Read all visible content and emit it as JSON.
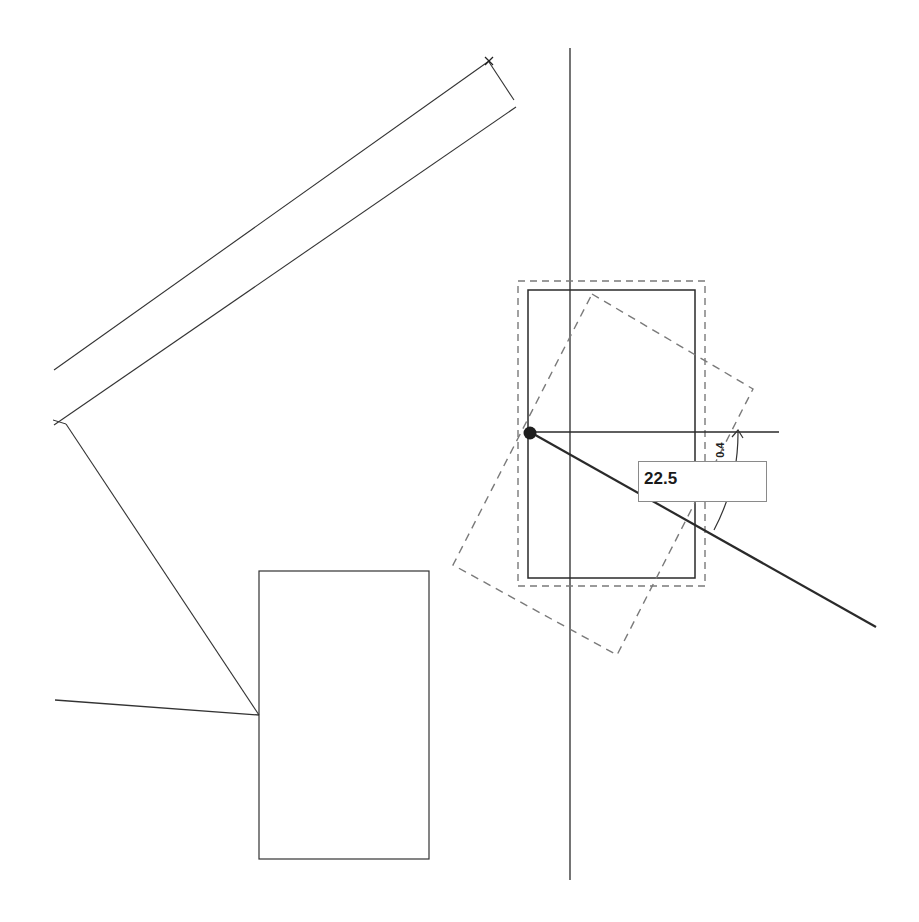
{
  "app": {
    "type": "CAD drawing canvas",
    "mode": "rotate"
  },
  "rotation_input": {
    "value": "22.5"
  },
  "angle_dimension": {
    "label": "0.4"
  },
  "colors": {
    "background": "#ffffff",
    "line": "#2a2a2a",
    "dashed_preview": "#7a7a7a",
    "input_border": "#8a8a8a"
  },
  "geometry": {
    "guide_vertical": {
      "x": 570,
      "y1": 48,
      "y2": 880
    },
    "wall_upper": {
      "x1": 54,
      "y1": 370,
      "x2": 489,
      "y2": 61
    },
    "wall_lower": {
      "x1": 54,
      "y1": 425,
      "x2": 516,
      "y2": 107
    },
    "wall_end_cap": {
      "x1": 489,
      "y1": 62,
      "x2": 514,
      "y2": 100
    },
    "diagonal_to_rect": {
      "x1": 66,
      "y1": 424,
      "x2": 259,
      "y2": 715
    },
    "left_line": {
      "x1": 55,
      "y1": 700,
      "x2": 259,
      "y2": 715
    },
    "lower_rect": {
      "x": 259,
      "y": 571,
      "w": 170,
      "h": 288
    },
    "selected_rect": {
      "x": 528,
      "y": 290,
      "w": 167,
      "h": 288
    },
    "selection_bbox": {
      "x": 518,
      "y": 281,
      "w": 187,
      "h": 305
    },
    "rotated_preview": [
      [
        592,
        294
      ],
      [
        753,
        389
      ],
      [
        617,
        655
      ],
      [
        453,
        565
      ]
    ],
    "pivot": {
      "x": 530,
      "y": 432
    },
    "reference_line": {
      "x1": 530,
      "y1": 432,
      "x2": 779,
      "y2": 432
    },
    "rotation_line": {
      "x1": 530,
      "y1": 432,
      "x2": 876,
      "y2": 627
    }
  }
}
